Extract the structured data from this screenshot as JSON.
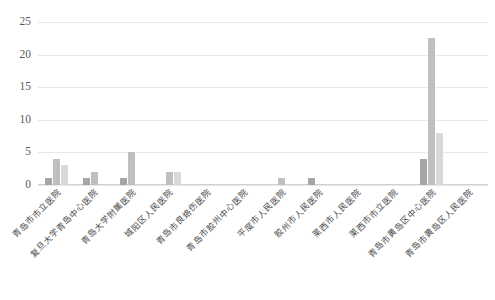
{
  "chart_data": {
    "type": "bar",
    "title": "",
    "subtitle": "",
    "xlabel": "",
    "ylabel": "",
    "ylim": [
      0,
      25
    ],
    "yticks": [
      0,
      5,
      10,
      15,
      20,
      25
    ],
    "grid": true,
    "legend": "none",
    "orientation": "vertical",
    "grouping": "grouped",
    "categories": [
      "青岛市市立医院",
      "复旦大学青岛中心医院",
      "青岛大学附属医院",
      "城阳区人民医院",
      "青岛市良烙伤医院",
      "青岛市胶州中心医院",
      "平度市人民医院",
      "胶州市人民医院",
      "莱西市人民医院",
      "莱西市市立医院",
      "青岛市黄岛区中心医院",
      "青岛市黄岛区人民医院"
    ],
    "series": [
      {
        "name": "series-1",
        "color": "#a6a6a6",
        "values": [
          1,
          1,
          1,
          0,
          0,
          0,
          0,
          1,
          0,
          0,
          4,
          0
        ]
      },
      {
        "name": "series-2",
        "color": "#bfbfbf",
        "values": [
          4,
          2,
          5,
          2,
          0,
          0,
          1,
          0,
          0,
          0,
          22.5,
          0
        ]
      },
      {
        "name": "series-3",
        "color": "#d9d9d9",
        "values": [
          3,
          0,
          0,
          2,
          0,
          0,
          0,
          0,
          0,
          0,
          8,
          0
        ]
      }
    ]
  },
  "colors": {
    "gridline": "#e8e8e8",
    "axis": "#d0d0d0",
    "tick_text": "#5a5a5a",
    "label_text": "#4a4a4a",
    "background": "#ffffff"
  }
}
